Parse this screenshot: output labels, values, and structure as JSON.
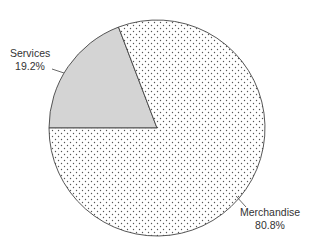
{
  "chart_data": {
    "type": "pie",
    "title": "",
    "slices": [
      {
        "label": "Services",
        "value": 19.2,
        "value_label": "19.2%",
        "fill": "#d4d4d4",
        "pattern": "solid-gray"
      },
      {
        "label": "Merchandise",
        "value": 80.8,
        "value_label": "80.8%",
        "fill": "#ffffff",
        "pattern": "dotted"
      }
    ],
    "start_angle_deg": 180,
    "direction": "clockwise",
    "legend": "none",
    "labels_outside_with_leader_lines": true
  },
  "labels": {
    "services": {
      "name": "Services",
      "pct": "19.2%"
    },
    "merchandise": {
      "name": "Merchandise",
      "pct": "80.8%"
    }
  }
}
